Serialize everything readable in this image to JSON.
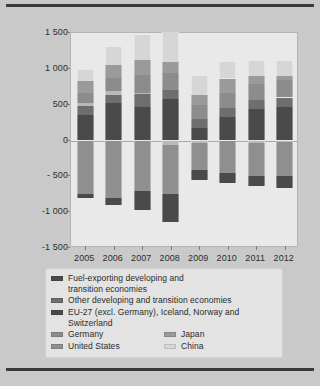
{
  "chart_data": {
    "type": "bar",
    "stacked": true,
    "title": "",
    "subtitle": "",
    "xlabel": "",
    "ylabel": "",
    "categories": [
      "2005",
      "2006",
      "2007",
      "2008",
      "2009",
      "2010",
      "2011",
      "2012"
    ],
    "ylim": [
      -1500,
      1500
    ],
    "yticks": [
      1500,
      1000,
      500,
      0,
      -500,
      -1000,
      -1500
    ],
    "ytick_labels": [
      "1 500",
      "1 000",
      "500",
      "0",
      "- 500",
      "-1 000",
      "-1 500"
    ],
    "grid": false,
    "zero_line": true,
    "legend_position": "bottom",
    "series": [
      {
        "name": "Fuel-exporting developing and transition economies",
        "color": "#4a4a4a",
        "values": [
          350,
          520,
          470,
          580,
          180,
          330,
          440,
          470
        ]
      },
      {
        "name": "Other developing and transition economies",
        "color": "#6e6e6e",
        "values": [
          135,
          120,
          180,
          130,
          120,
          130,
          130,
          130
        ]
      },
      {
        "name": "EU-27 (excl. Germany), Iceland, Norway and Switzerland",
        "color": "#b9b9b9",
        "values": [
          40,
          55,
          10,
          -60,
          -40,
          -10,
          -30,
          -20
        ]
      },
      {
        "name": "Germany",
        "color": "#8c8c8c",
        "values": [
          140,
          180,
          250,
          230,
          190,
          200,
          215,
          240
        ]
      },
      {
        "name": "Japan",
        "color": "#9a9a9a",
        "values": [
          165,
          175,
          210,
          160,
          145,
          205,
          120,
          60
        ]
      },
      {
        "name": "China",
        "color": "#d6d6d6",
        "values": [
          160,
          250,
          350,
          410,
          260,
          230,
          200,
          215
        ]
      },
      {
        "name": "United States",
        "color": "#8f8f8f",
        "values": [
          -745,
          -800,
          -710,
          -680,
          -375,
          -445,
          -465,
          -475
        ]
      },
      {
        "name": "Rest (deficit, fuel-exporting/other)",
        "color": "#4a4a4a",
        "values": [
          -55,
          -95,
          -255,
          -395,
          -130,
          -140,
          -140,
          -165
        ]
      }
    ],
    "totals_positive": [
      830,
      1145,
      1300,
      1390,
      790,
      1015,
      1105,
      1150
    ],
    "totals_negative": [
      -800,
      -895,
      -965,
      -1075,
      -505,
      -585,
      -605,
      -640
    ]
  },
  "axis": {
    "y_labels": [
      "1 500",
      "1 000",
      "500",
      "0",
      "- 500",
      "-1 000",
      "-1 500"
    ],
    "x_labels": [
      "2005",
      "2006",
      "2007",
      "2008",
      "2009",
      "2010",
      "2011",
      "2012"
    ]
  },
  "legend": {
    "entries": [
      {
        "label": "Fuel-exporting developing and",
        "label2": "transition economies",
        "color": "#4a4a4a"
      },
      {
        "label": "Other developing and transition economies",
        "color": "#6e6e6e"
      },
      {
        "label": "EU-27 (excl. Germany), Iceland, Norway and",
        "label2": "Switzerland",
        "color": "#4a4a4a"
      },
      {
        "label": "Germany",
        "color": "#8c8c8c"
      },
      {
        "label": "Japan",
        "color": "#9a9a9a"
      },
      {
        "label": "United States",
        "color": "#8f8f8f"
      },
      {
        "label": "China",
        "color": "#d6d6d6"
      }
    ]
  },
  "colors": {
    "page_background": "#c9c9c9",
    "plot_background": "#e9e9e9",
    "rule": "#3a3a3a",
    "text": "#2b2b2b"
  }
}
